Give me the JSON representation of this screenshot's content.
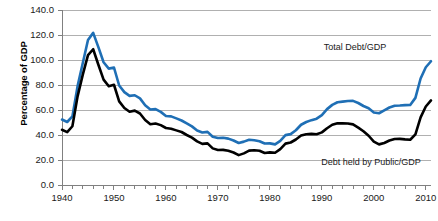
{
  "chart_data": {
    "type": "line",
    "title": "",
    "xlabel": "",
    "ylabel": "Percentage of GDP",
    "xlim": [
      1940,
      2011
    ],
    "ylim": [
      0,
      140
    ],
    "grid": true,
    "legend_position": "inline-annotations",
    "y_ticks": [
      "0.0",
      "20.0",
      "40.0",
      "60.0",
      "80.0",
      "100.0",
      "120.0",
      "140.0"
    ],
    "y_tick_values": [
      0,
      20,
      40,
      60,
      80,
      100,
      120,
      140
    ],
    "x_ticks": [
      "1940",
      "1950",
      "1960",
      "1970",
      "1980",
      "1990",
      "2000",
      "2010"
    ],
    "x_tick_values": [
      1940,
      1950,
      1960,
      1970,
      1980,
      1990,
      2000,
      2010
    ],
    "x_minor_tick_step": 2,
    "colors": {
      "total_debt": "#1F6FB5",
      "public_debt": "#000000",
      "gridline": "#b0b0b0",
      "axis": "#808080",
      "background": "#ffffff"
    },
    "x": [
      1940,
      1941,
      1942,
      1943,
      1944,
      1945,
      1946,
      1947,
      1948,
      1949,
      1950,
      1951,
      1952,
      1953,
      1954,
      1955,
      1956,
      1957,
      1958,
      1959,
      1960,
      1961,
      1962,
      1963,
      1964,
      1965,
      1966,
      1967,
      1968,
      1969,
      1970,
      1971,
      1972,
      1973,
      1974,
      1975,
      1976,
      1977,
      1978,
      1979,
      1980,
      1981,
      1982,
      1983,
      1984,
      1985,
      1986,
      1987,
      1988,
      1989,
      1990,
      1991,
      1992,
      1993,
      1994,
      1995,
      1996,
      1997,
      1998,
      1999,
      2000,
      2001,
      2002,
      2003,
      2004,
      2005,
      2006,
      2007,
      2008,
      2009,
      2010,
      2011
    ],
    "series": [
      {
        "name": "Total Debt/GDP",
        "color": "#1F6FB5",
        "annotation": "Total Debt/GDP",
        "values": [
          52.4,
          50.4,
          54.9,
          79.1,
          97.6,
          116.0,
          121.7,
          110.3,
          98.2,
          93.1,
          94.0,
          79.6,
          74.3,
          71.3,
          71.8,
          69.3,
          63.8,
          60.4,
          60.7,
          58.5,
          55.2,
          54.9,
          53.3,
          51.6,
          49.3,
          46.9,
          43.6,
          42.0,
          42.5,
          38.6,
          37.6,
          37.8,
          37.1,
          35.6,
          33.6,
          34.7,
          36.2,
          35.8,
          35.0,
          33.2,
          33.3,
          32.5,
          35.3,
          39.9,
          40.7,
          43.8,
          48.2,
          50.4,
          51.9,
          53.1,
          55.9,
          60.7,
          64.1,
          66.2,
          66.7,
          67.2,
          67.3,
          65.6,
          63.2,
          61.4,
          58.0,
          57.4,
          59.7,
          62.0,
          63.4,
          63.6,
          63.9,
          64.0,
          69.7,
          85.2,
          94.2,
          99.0
        ]
      },
      {
        "name": "Debt held by Public/GDP",
        "color": "#000000",
        "annotation": "Debt held by Public/GDP",
        "values": [
          44.2,
          42.3,
          47.0,
          70.9,
          88.3,
          103.9,
          108.6,
          96.2,
          84.3,
          79.0,
          80.2,
          66.9,
          61.6,
          58.6,
          59.5,
          57.2,
          52.0,
          48.6,
          49.2,
          47.9,
          45.6,
          45.0,
          43.7,
          42.4,
          40.0,
          37.9,
          34.9,
          32.9,
          33.3,
          29.3,
          28.0,
          28.1,
          27.4,
          26.0,
          23.9,
          25.3,
          27.5,
          27.8,
          27.4,
          25.6,
          26.1,
          25.8,
          28.7,
          33.1,
          34.0,
          36.4,
          39.6,
          40.6,
          40.9,
          40.6,
          42.1,
          45.4,
          48.2,
          49.4,
          49.3,
          49.2,
          48.5,
          45.9,
          43.0,
          39.4,
          34.7,
          32.5,
          33.6,
          35.6,
          36.8,
          36.9,
          36.5,
          36.2,
          40.5,
          54.1,
          62.8,
          67.7
        ]
      }
    ]
  },
  "axis": {
    "y_title": "Percentage of GDP"
  }
}
